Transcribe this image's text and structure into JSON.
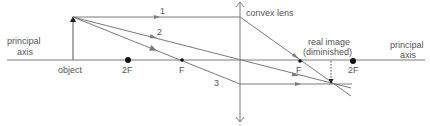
{
  "diagram": {
    "type": "ray diagram",
    "colors": {
      "line": "#7a7a7a",
      "text": "#555555",
      "point": "#111111"
    },
    "labels": {
      "principal_axis_left_1": "principal",
      "principal_axis_left_2": "axis",
      "principal_axis_right_1": "principal",
      "principal_axis_right_2": "axis",
      "object": "object",
      "two_f_left": "2F",
      "f_left": "F",
      "f_right": "F",
      "two_f_right": "2F",
      "lens": "convex lens",
      "image_1": "real image",
      "image_2": "(diminished)",
      "ray_1": "1",
      "ray_2": "2",
      "ray_3": "3"
    }
  }
}
